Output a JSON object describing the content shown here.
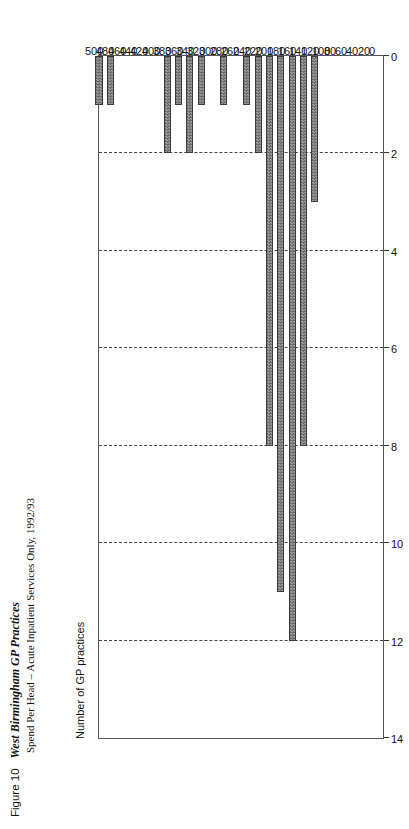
{
  "figure": {
    "label": "Figure 10",
    "name": "West Birmingham GP Practices",
    "subtitle": "Spend Per Head – Acute Inpatient Services Only, 1992/93"
  },
  "axes": {
    "count_caption": "Number of GP practices",
    "count_ticks": [
      "14",
      "12",
      "10",
      "8",
      "6",
      "4",
      "2",
      "0"
    ],
    "spend_ticks": [
      "0",
      "20",
      "40",
      "60",
      "80",
      "100",
      "120",
      "140",
      "160",
      "180",
      "200",
      "220",
      "240",
      "260",
      "280",
      "300",
      "320",
      "340",
      "360",
      "380",
      "400",
      "420",
      "440",
      "460",
      "480",
      "500"
    ]
  },
  "colors": {
    "bar_fill": "#7f7f7f",
    "bar_border": "#3a3a3a",
    "grid": "#444444",
    "frame": "#555555"
  },
  "chart_data": {
    "type": "bar",
    "orientation": "horizontal",
    "title": "West Birmingham GP Practices",
    "subtitle": "Spend Per Head – Acute Inpatient Services Only, 1992/93",
    "xlabel": "Number of GP practices",
    "ylabel": "Spend Per Head (£)",
    "xlim": [
      0,
      14
    ],
    "ylim": [
      0,
      500
    ],
    "grid": true,
    "legend": "none",
    "categories": [
      "0",
      "20",
      "40",
      "60",
      "80",
      "100",
      "120",
      "140",
      "160",
      "180",
      "200",
      "220",
      "240",
      "260",
      "280",
      "300",
      "320",
      "340",
      "360",
      "380",
      "400",
      "420",
      "440",
      "460",
      "480",
      "500"
    ],
    "values": [
      0,
      0,
      0,
      0,
      0,
      0,
      3,
      8,
      12,
      11,
      8,
      2,
      1,
      0,
      1,
      0,
      1,
      2,
      1,
      2,
      0,
      0,
      0,
      0,
      1,
      1
    ]
  }
}
